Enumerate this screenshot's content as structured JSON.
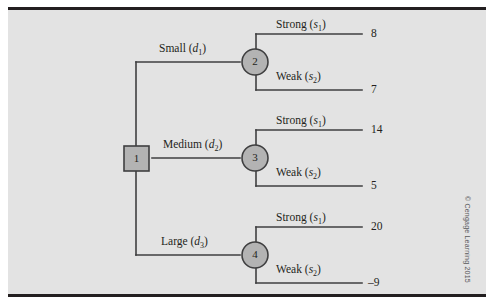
{
  "figure": {
    "credit": "© Cengage Learning 2015",
    "background_color": "#e3e3e3",
    "rule_color": "#231f20",
    "line_color": "#3f3f40",
    "node_fill": "#b3b3b3",
    "node_stroke": "#3f3f40"
  },
  "decision_node": {
    "id": "1",
    "shape": "square",
    "name": "decision-node-1"
  },
  "branches": [
    {
      "label_text": "Small",
      "label_symbol": "d",
      "label_subscript": "1",
      "chance_node": "2",
      "outcomes": [
        {
          "label_text": "Strong",
          "label_symbol": "s",
          "label_subscript": "1",
          "payoff": "8"
        },
        {
          "label_text": "Weak",
          "label_symbol": "s",
          "label_subscript": "2",
          "payoff": "7"
        }
      ]
    },
    {
      "label_text": "Medium",
      "label_symbol": "d",
      "label_subscript": "2",
      "chance_node": "3",
      "outcomes": [
        {
          "label_text": "Strong",
          "label_symbol": "s",
          "label_subscript": "1",
          "payoff": "14"
        },
        {
          "label_text": "Weak",
          "label_symbol": "s",
          "label_subscript": "2",
          "payoff": "5"
        }
      ]
    },
    {
      "label_text": "Large",
      "label_symbol": "d",
      "label_subscript": "3",
      "chance_node": "4",
      "outcomes": [
        {
          "label_text": "Strong",
          "label_symbol": "s",
          "label_subscript": "1",
          "payoff": "20"
        },
        {
          "label_text": "Weak",
          "label_symbol": "s",
          "label_subscript": "2",
          "payoff": "–9"
        }
      ]
    }
  ]
}
